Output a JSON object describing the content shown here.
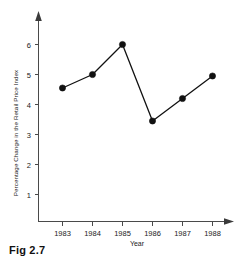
{
  "figure": {
    "caption": "Fig 2.7"
  },
  "chart_data": {
    "type": "line",
    "title": "",
    "xlabel": "Year",
    "ylabel": "Percentage Change in the Retail Price Index",
    "categories": [
      "1983",
      "1984",
      "1985",
      "1986",
      "1987",
      "1988"
    ],
    "values": [
      4.55,
      5.0,
      6.0,
      3.45,
      4.2,
      4.95
    ],
    "series": [
      {
        "name": "Percentage Change in the Retail Price Index",
        "values": [
          4.55,
          5.0,
          6.0,
          3.45,
          4.2,
          4.95
        ]
      }
    ],
    "x": [
      1983,
      1984,
      1985,
      1986,
      1987,
      1988
    ],
    "ytick_labels": [
      "1",
      "2",
      "3",
      "4",
      "5",
      "6"
    ],
    "ytick_values": [
      1,
      2,
      3,
      4,
      5,
      6
    ],
    "xtick_labels": [
      "1983",
      "1984",
      "1985",
      "1986",
      "1987",
      "1988"
    ],
    "ylim": [
      0,
      6.6
    ],
    "xlim": [
      1982.35,
      1988.8
    ],
    "grid": false,
    "legend": false,
    "legend_position": "none",
    "marker": "filled-circle",
    "line_color": "#111111",
    "marker_color": "#111111",
    "axis_color": "#4a4a4a",
    "background_color": "#ffffff",
    "axis_arrows": {
      "x": "right",
      "y": "up"
    }
  }
}
